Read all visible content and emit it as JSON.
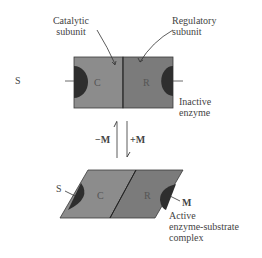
{
  "labels": {
    "catalytic": [
      "Catalytic",
      "subunit"
    ],
    "regulatory": [
      "Regulatory",
      "subunit"
    ],
    "substrate_top": "S",
    "inactive": [
      "Inactive",
      "enzyme"
    ],
    "minus_m": "−M",
    "plus_m": "+M",
    "substrate_bottom": "S",
    "modulator": "M",
    "active": [
      "Active",
      "enzyme-substrate",
      "complex"
    ]
  },
  "subunits": {
    "c": "C",
    "r": "R"
  },
  "colors": {
    "catalytic_fill": "#8c8c8c",
    "regulatory_fill": "#7c7c7c",
    "site_fill": "#2e2e2e",
    "outline": "#3a3a3a"
  }
}
